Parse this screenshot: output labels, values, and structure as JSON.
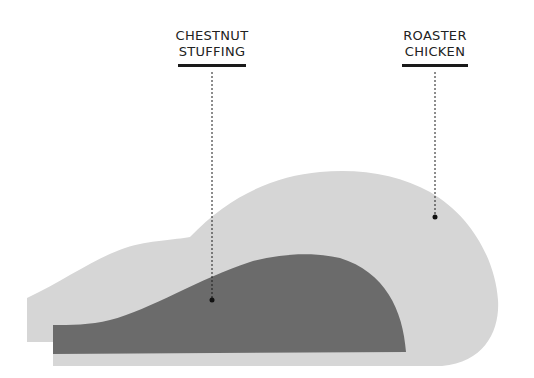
{
  "diagram": {
    "type": "annotated-illustration",
    "labels": [
      {
        "id": "stuffing",
        "lines": [
          "CHESTNUT",
          "STUFFING"
        ]
      },
      {
        "id": "chicken",
        "lines": [
          "ROASTER",
          "CHICKEN"
        ]
      }
    ],
    "colors": {
      "chicken_fill": "#d6d6d6",
      "stuffing_fill": "#6b6b6b",
      "text": "#222222",
      "rule": "#1a1a1a",
      "leader": "#1a1a1a"
    }
  }
}
